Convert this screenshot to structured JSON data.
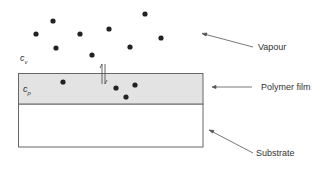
{
  "diagram": {
    "labels": {
      "vapour": "Vapour",
      "polymer_film": "Polymer film",
      "substrate": "Substrate"
    },
    "symbols": {
      "vapour_conc": {
        "base": "c",
        "sub": "v"
      },
      "polymer_conc": {
        "base": "c",
        "sub": "p"
      }
    },
    "colors": {
      "film_fill": "#e3e3e3",
      "substrate_fill": "#ffffff",
      "outline": "#666666",
      "molecule": "#222222",
      "arrow": "#555555"
    },
    "vapour_molecules": [
      [
        36,
        34
      ],
      [
        53,
        21
      ],
      [
        56,
        48
      ],
      [
        80,
        34
      ],
      [
        92,
        55
      ],
      [
        109,
        29
      ],
      [
        130,
        47
      ],
      [
        145,
        14
      ],
      [
        161,
        38
      ]
    ],
    "film_molecules": [
      [
        63,
        82
      ],
      [
        116,
        88
      ],
      [
        126,
        97
      ],
      [
        135,
        85
      ]
    ],
    "equilibrium_arrow": "double-headed (sorption/desorption)"
  }
}
